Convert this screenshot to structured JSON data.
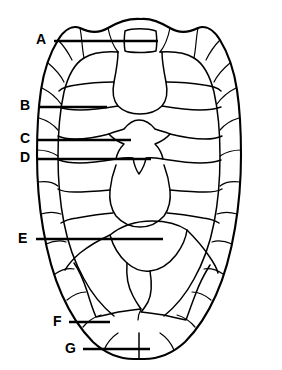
{
  "figure": {
    "view": "dorsal",
    "background_color": "#ffffff",
    "line_color": "#000000",
    "width": 282,
    "height": 370
  },
  "labels": [
    {
      "id": "A",
      "text": "A",
      "text_x": 41,
      "text_y": 40,
      "line_x1": 54,
      "line_x2": 158,
      "line_y": 41,
      "target": "nuchal-scute"
    },
    {
      "id": "B",
      "text": "B",
      "text_x": 25,
      "text_y": 106,
      "line_x1": 38,
      "line_x2": 107,
      "line_y": 107,
      "target": "left-pleural-scute"
    },
    {
      "id": "C",
      "text": "C",
      "text_x": 25,
      "text_y": 139,
      "line_x1": 38,
      "line_x2": 131,
      "line_y": 140,
      "target": "third-vertebral-scute-edge"
    },
    {
      "id": "D",
      "text": "D",
      "text_x": 25,
      "text_y": 158,
      "line_x1": 38,
      "line_x2": 151,
      "line_y": 159,
      "target": "third-vertebral-scute-center"
    },
    {
      "id": "E",
      "text": "E",
      "text_x": 23,
      "text_y": 239,
      "line_x1": 36,
      "line_x2": 163,
      "line_y": 239,
      "target": "posterior-vertebral-scute"
    },
    {
      "id": "F",
      "text": "F",
      "text_x": 57,
      "text_y": 322,
      "line_x1": 69,
      "line_x2": 110,
      "line_y": 322,
      "target": "posterior-marginal-scute"
    },
    {
      "id": "G",
      "text": "G",
      "text_x": 69,
      "text_y": 349,
      "line_x1": 83,
      "line_x2": 150,
      "line_y": 349,
      "target": "supracaudal-marginal-scute"
    }
  ],
  "label_order": [
    "A",
    "B",
    "C",
    "D",
    "E",
    "F",
    "G"
  ]
}
